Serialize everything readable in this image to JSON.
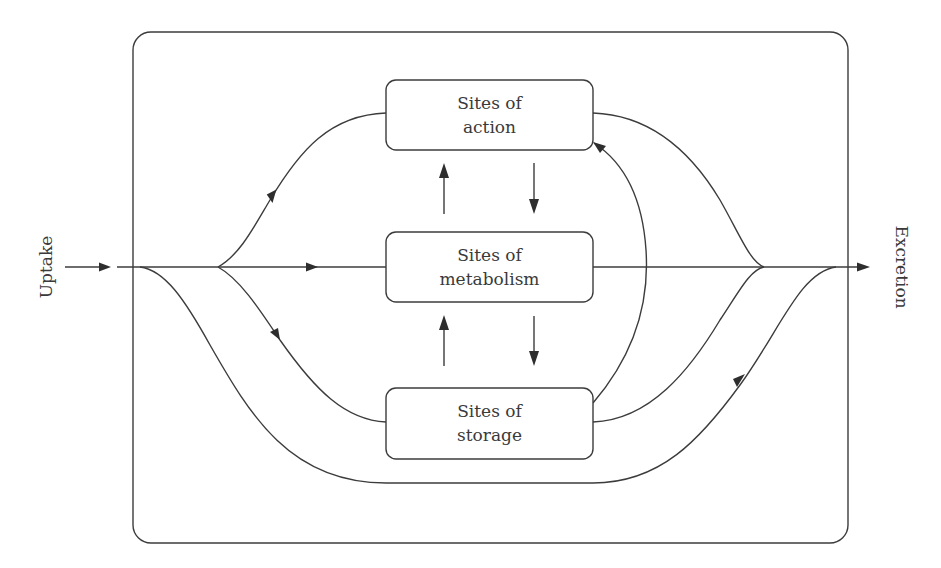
{
  "diagram": {
    "type": "flow",
    "input_label": "Uptake",
    "output_label": "Excretion",
    "nodes": [
      {
        "id": "action",
        "line1": "Sites of",
        "line2": "action"
      },
      {
        "id": "metabolism",
        "line1": "Sites of",
        "line2": "metabolism"
      },
      {
        "id": "storage",
        "line1": "Sites of",
        "line2": "storage"
      }
    ],
    "edges": [
      {
        "from": "Uptake",
        "to": "metabolism",
        "style": "straight"
      },
      {
        "from": "Uptake",
        "to": "action",
        "style": "curve"
      },
      {
        "from": "Uptake",
        "to": "storage",
        "style": "curve"
      },
      {
        "from": "Uptake",
        "to": "Excretion",
        "style": "bypass-curve-below"
      },
      {
        "from": "metabolism",
        "to": "action"
      },
      {
        "from": "action",
        "to": "metabolism"
      },
      {
        "from": "storage",
        "to": "metabolism"
      },
      {
        "from": "metabolism",
        "to": "storage"
      },
      {
        "from": "storage",
        "to": "action",
        "style": "arc"
      },
      {
        "from": "action",
        "to": "Excretion"
      },
      {
        "from": "metabolism",
        "to": "Excretion"
      },
      {
        "from": "storage",
        "to": "Excretion"
      }
    ],
    "colors": {
      "stroke": "#3c3c3c",
      "background": "#ffffff",
      "text": "#3a3a3a"
    }
  }
}
